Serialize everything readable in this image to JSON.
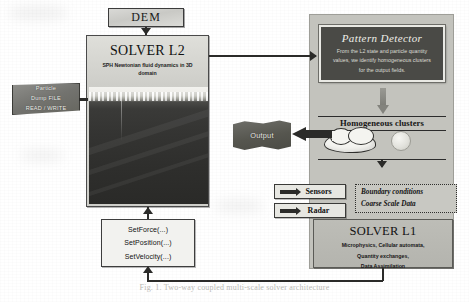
{
  "diagram": {
    "title_caption": "Fig. 1.  Two-way coupled multi-scale solver architecture",
    "dem": {
      "label": "DEM"
    },
    "solver_l2": {
      "title": "SOLVER L2",
      "subtitle": "SPH Newtonian fluid dynamics in 3D domain"
    },
    "particle_file": {
      "line1": "Particle",
      "line2": "Dump FILE",
      "line3": "READ / WRITE"
    },
    "api_calls": {
      "items": [
        "SetForce(...)",
        "SetPosition(...)",
        "SetVelocity(...)"
      ]
    },
    "pattern_detector": {
      "title": "Pattern Detector",
      "body": "From the L2 state and particle quantity values, we identify homogeneous clusters for the output fields."
    },
    "clusters": {
      "label": "Homogeneous clusters"
    },
    "output": {
      "label": "Output"
    },
    "inputs": {
      "sensors": "Sensors",
      "radar": "Radar"
    },
    "boundary": {
      "line1": "Boundary conditions",
      "line2": "Coarse Scale Data"
    },
    "solver_l1": {
      "title": "SOLVER L1",
      "sub_line1": "Microphysics, Cellular automata,",
      "sub_line2": "Quantity exchanges,",
      "sub_line3": "Data Assimilation"
    },
    "colors": {
      "panel": "#c3c3bd",
      "dark_box": "#4a4a46",
      "stroke": "#2b2b29",
      "paper": "#ffffff"
    }
  }
}
